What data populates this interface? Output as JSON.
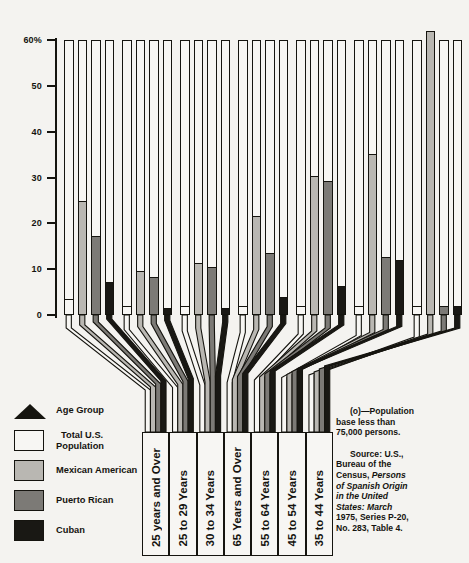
{
  "chart_data": {
    "type": "bar",
    "title": "",
    "subtitle": "",
    "xlabel": "Age Group",
    "ylabel": "",
    "ylim": [
      0,
      63
    ],
    "yticks": [
      0,
      10,
      20,
      30,
      40,
      50,
      60
    ],
    "ytick_labels": [
      "0",
      "10",
      "20",
      "30",
      "40",
      "50",
      "60%"
    ],
    "grid": false,
    "legend_position": "bottom-left",
    "orientation": "vertical",
    "grouping": "grouped",
    "categories": [
      "25 years and Over",
      "25 to 29 Years",
      "30 to 34 Years",
      "65 Years and Over",
      "55 to 64 Years",
      "45 to 54 Years",
      "35 to 44 Years"
    ],
    "series": [
      {
        "name": "Total U.S. Population",
        "color": "#f7f6f3",
        "values": [
          3.5,
          2.0,
          2.0,
          2.0,
          2.0,
          2.0,
          2.0
        ]
      },
      {
        "name": "Mexican American",
        "color": "#b9b7b2",
        "values": [
          24.8,
          9.7,
          11.4,
          21.7,
          30.3,
          35.2,
          62.0
        ]
      },
      {
        "name": "Puerto Rican",
        "color": "#7c7a76",
        "values": [
          17.3,
          8.4,
          10.5,
          13.6,
          29.3,
          12.6,
          2.0
        ]
      },
      {
        "name": "Cuban",
        "color": "#191814",
        "values": [
          7.3,
          1.6,
          1.6,
          3.9,
          6.3,
          11.9,
          2.0
        ]
      }
    ],
    "annotations": [
      "(o)—Population base less than 75,000 persons."
    ]
  },
  "axis": {
    "tick_labels": [
      "60%",
      "50",
      "40",
      "30",
      "20",
      "10",
      "0"
    ]
  },
  "legend": {
    "header": "Age Group",
    "items": [
      {
        "label_line1": "Total U.S.",
        "label_line2": "Population",
        "color": "#f7f6f3"
      },
      {
        "label_line1": "Mexican American",
        "label_line2": "",
        "color": "#b9b7b2"
      },
      {
        "label_line1": "Puerto Rican",
        "label_line2": "",
        "color": "#7c7a76"
      },
      {
        "label_line1": "Cuban",
        "label_line2": "",
        "color": "#191814"
      }
    ]
  },
  "category_labels": [
    "25 years and Over",
    "25 to 29 Years",
    "30 to 34 Years",
    "65 Years and Over",
    "55 to 64 Years",
    "45 to 54 Years",
    "35 to 44 Years"
  ],
  "notes": {
    "footnote_line1": "(o)—Population",
    "footnote_line2": "base less than",
    "footnote_line3": "75,000 persons.",
    "source_line1": "Source: U.S.,",
    "source_line2": "Bureau of the",
    "source_line3_plain": "Census, ",
    "source_line3_italic": "Persons",
    "source_line4_italic": "of Spanish Origin",
    "source_line5_italic": "in the United",
    "source_line6_italic": "States: March",
    "source_line7": "1975, Series P-20,",
    "source_line8": "No. 283, Table 4."
  },
  "colors": {
    "ink": "#15140f",
    "paper": "#f4f3f0",
    "total_us": "#f7f6f3",
    "mexican_american": "#b9b7b2",
    "puerto_rican": "#7c7a76",
    "cuban": "#191814"
  }
}
